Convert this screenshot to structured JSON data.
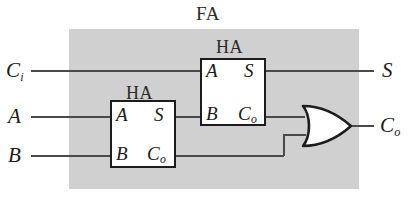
{
  "diagram": {
    "title": "FA",
    "kind": "full-adder-from-half-adders",
    "region_fill": "#d0d0d0",
    "line_color": "#4a4a4a",
    "box_border_color": "#1c1c1c",
    "external_inputs": [
      {
        "label": "C",
        "sub": "i",
        "name": "carry-in"
      },
      {
        "label": "A",
        "sub": "",
        "name": "operand-a"
      },
      {
        "label": "B",
        "sub": "",
        "name": "operand-b"
      }
    ],
    "external_outputs": [
      {
        "label": "S",
        "sub": "",
        "name": "sum-out"
      },
      {
        "label": "C",
        "sub": "o",
        "name": "carry-out"
      }
    ],
    "blocks": [
      {
        "title": "HA",
        "name": "half-adder-upper",
        "inputs": [
          {
            "label": "A",
            "sub": ""
          },
          {
            "label": "B",
            "sub": ""
          }
        ],
        "outputs": [
          {
            "label": "S",
            "sub": ""
          },
          {
            "label": "C",
            "sub": "o"
          }
        ]
      },
      {
        "title": "HA",
        "name": "half-adder-lower",
        "inputs": [
          {
            "label": "A",
            "sub": ""
          },
          {
            "label": "B",
            "sub": ""
          }
        ],
        "outputs": [
          {
            "label": "S",
            "sub": ""
          },
          {
            "label": "C",
            "sub": "o"
          }
        ]
      }
    ],
    "gates": [
      {
        "type": "OR",
        "name": "or-gate",
        "inputs": 2,
        "outputs": 1
      }
    ]
  }
}
